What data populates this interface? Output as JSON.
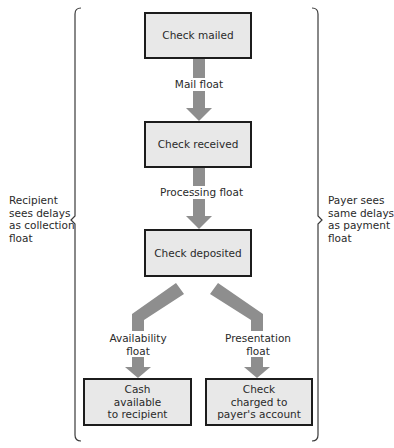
{
  "diagram": {
    "type": "flowchart",
    "colors": {
      "box_fill": "#e8e8e8",
      "box_border": "#1c1c1c",
      "arrow": "#8e8e8e",
      "bracket": "#3a3a3a"
    },
    "nodes": [
      {
        "id": "check-mailed",
        "label": "Check mailed"
      },
      {
        "id": "check-received",
        "label": "Check received"
      },
      {
        "id": "check-deposited",
        "label": "Check deposited"
      },
      {
        "id": "cash-available",
        "label_lines": [
          "Cash",
          "available",
          "to recipient"
        ]
      },
      {
        "id": "check-charged",
        "label_lines": [
          "Check",
          "charged to",
          "payer's account"
        ]
      }
    ],
    "edges": [
      {
        "from": "check-mailed",
        "to": "check-received",
        "label": "Mail float"
      },
      {
        "from": "check-received",
        "to": "check-deposited",
        "label": "Processing float"
      },
      {
        "from": "check-deposited",
        "to": "cash-available",
        "label_lines": [
          "Availability",
          "float"
        ]
      },
      {
        "from": "check-deposited",
        "to": "check-charged",
        "label_lines": [
          "Presentation",
          "float"
        ]
      }
    ],
    "left_brace_note": [
      "Recipient",
      "sees delays",
      "as collection",
      "float"
    ],
    "right_brace_note": [
      "Payer sees",
      "same delays",
      "as payment",
      "float"
    ]
  }
}
